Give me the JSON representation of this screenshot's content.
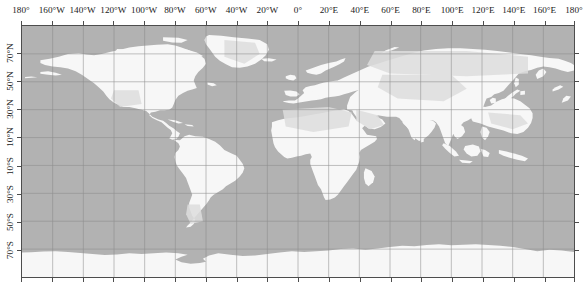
{
  "figure": {
    "type": "world-map",
    "projection": "equirectangular",
    "title": "",
    "background_color": "#ffffff"
  },
  "chart_data": {
    "type": "map",
    "title": "",
    "xlabel": "",
    "ylabel": "",
    "xlim": [
      -180,
      180
    ],
    "ylim": [
      -90,
      90
    ],
    "grid": true,
    "grid_spacing_deg": 20,
    "legend": null,
    "colors": {
      "ocean": "#b2b2b2",
      "land": "#f7f7f7",
      "land_shaded": "#dcdcdc",
      "gridline": "#8c8c8c",
      "frame": "#4d4d4d",
      "tick_text": "#1a1a1a"
    },
    "longitude_ticks": [
      {
        "value": -180,
        "label": "180°",
        "x_px": 21
      },
      {
        "value": -160,
        "label": "160°W",
        "x_px": 51.8
      },
      {
        "value": -140,
        "label": "140°W",
        "x_px": 82.6
      },
      {
        "value": -120,
        "label": "120°W",
        "x_px": 113.4
      },
      {
        "value": -100,
        "label": "100°W",
        "x_px": 144.2
      },
      {
        "value": -80,
        "label": "80°W",
        "x_px": 175.0
      },
      {
        "value": -60,
        "label": "60°W",
        "x_px": 205.8
      },
      {
        "value": -40,
        "label": "40°W",
        "x_px": 236.6
      },
      {
        "value": -20,
        "label": "20°W",
        "x_px": 267.4
      },
      {
        "value": 0,
        "label": "0°",
        "x_px": 298.0
      },
      {
        "value": 20,
        "label": "20°E",
        "x_px": 329.0
      },
      {
        "value": 40,
        "label": "40°E",
        "x_px": 359.8
      },
      {
        "value": 60,
        "label": "60°E",
        "x_px": 390.6
      },
      {
        "value": 80,
        "label": "80°E",
        "x_px": 421.4
      },
      {
        "value": 100,
        "label": "100°E",
        "x_px": 452.2
      },
      {
        "value": 120,
        "label": "120°E",
        "x_px": 483.0
      },
      {
        "value": 140,
        "label": "140°E",
        "x_px": 513.8
      },
      {
        "value": 160,
        "label": "160°E",
        "x_px": 544.6
      },
      {
        "value": 180,
        "label": "180°",
        "x_px": 574.0
      }
    ],
    "latitude_ticks": [
      {
        "value": 70,
        "label": "70°N",
        "y_px": 53.1
      },
      {
        "value": 50,
        "label": "50°N",
        "y_px": 81.2
      },
      {
        "value": 30,
        "label": "30°N",
        "y_px": 109.3
      },
      {
        "value": 10,
        "label": "10°N",
        "y_px": 137.4
      },
      {
        "value": -10,
        "label": "10°S",
        "y_px": 165.6
      },
      {
        "value": -30,
        "label": "30°S",
        "y_px": 193.7
      },
      {
        "value": -50,
        "label": "50°S",
        "y_px": 221.8
      },
      {
        "value": -70,
        "label": "70°S",
        "y_px": 249.9
      }
    ]
  }
}
